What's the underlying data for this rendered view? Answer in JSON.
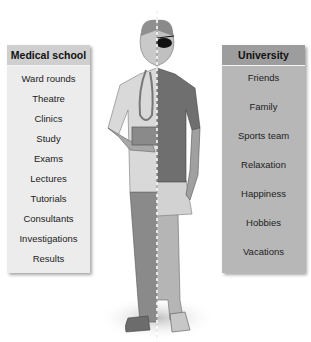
{
  "left_panel": {
    "title": "Medical school",
    "items": [
      "Ward rounds",
      "Theatre",
      "Clinics",
      "Study",
      "Exams",
      "Lectures",
      "Tutorials",
      "Consultants",
      "Investigations",
      "Results"
    ],
    "header_color": "#cfcfcf",
    "body_color": "#ececec"
  },
  "right_panel": {
    "title": "University",
    "items": [
      "Friends",
      "Family",
      "Sports team",
      "Relaxation",
      "Happiness",
      "Hobbies",
      "Vacations"
    ],
    "header_color": "#9d9d9d",
    "body_color": "#b7b7b7"
  },
  "figure": {
    "left_side_icons": [
      "stethoscope-icon",
      "tablet-icon"
    ],
    "right_side_icons": [
      "eye-patch-icon",
      "sneaker-icon"
    ]
  }
}
